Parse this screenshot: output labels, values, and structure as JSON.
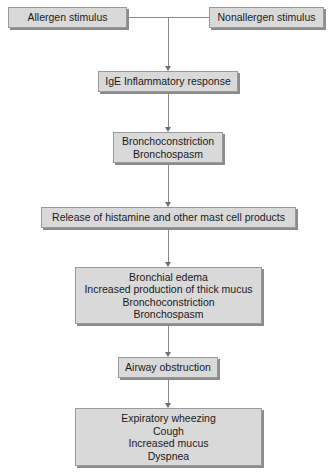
{
  "diagram": {
    "type": "flowchart",
    "colors": {
      "box_fill": "#d9d9d9",
      "box_border": "#9a9a9a",
      "box_shadow": "#8c8c8c",
      "connector": "#8a8a8a",
      "text": "#1a1a1a"
    },
    "inputs": {
      "left": {
        "lines": [
          "Allergen stimulus"
        ]
      },
      "right": {
        "lines": [
          "Nonallergen stimulus"
        ]
      }
    },
    "steps": [
      {
        "id": "ige",
        "lines": [
          "IgE Inflammatory response"
        ]
      },
      {
        "id": "broncho1",
        "lines": [
          "Bronchoconstriction",
          "Bronchospasm"
        ]
      },
      {
        "id": "release",
        "lines": [
          "Release of histamine and other mast cell products"
        ]
      },
      {
        "id": "edema",
        "lines": [
          "Bronchial edema",
          "Increased production of thick mucus",
          "Bronchoconstriction",
          "Bronchospasm"
        ]
      },
      {
        "id": "airway",
        "lines": [
          "Airway obstruction"
        ]
      },
      {
        "id": "symptoms",
        "lines": [
          "Expiratory wheezing",
          "Cough",
          "Increased mucus",
          "Dyspnea"
        ]
      }
    ],
    "edges": [
      {
        "from": [
          "Allergen stimulus",
          "Nonallergen stimulus"
        ],
        "to": "IgE Inflammatory response"
      },
      {
        "from": "IgE Inflammatory response",
        "to": "Bronchoconstriction / Bronchospasm"
      },
      {
        "from": "Bronchoconstriction / Bronchospasm",
        "to": "Release of histamine and other mast cell products"
      },
      {
        "from": "Release of histamine and other mast cell products",
        "to": "Bronchial edema ..."
      },
      {
        "from": "Bronchial edema ...",
        "to": "Airway obstruction"
      },
      {
        "from": "Airway obstruction",
        "to": "Expiratory wheezing ..."
      }
    ]
  }
}
